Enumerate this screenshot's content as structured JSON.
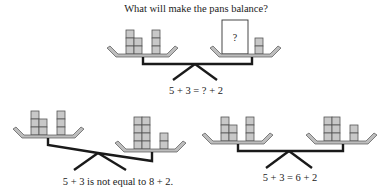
{
  "title": "What will make the pans balance?",
  "colors": {
    "block_fill": "#c8c8c8",
    "block_stroke": "#555555",
    "beam": "#1a1a1a",
    "text": "#222222"
  },
  "diagrams": [
    {
      "id": "top",
      "state": "question",
      "left_pan": {
        "stacks": [
          3,
          2,
          3
        ],
        "total": 5
      },
      "right_pan": {
        "unknown_box_label": "?",
        "stacks": [
          2
        ],
        "total": 2
      },
      "caption": "5 + 3 = ? + 2"
    },
    {
      "id": "bottom-left",
      "state": "unbalanced",
      "left_pan": {
        "stacks": [
          3,
          2,
          3
        ],
        "total": 8
      },
      "right_pan": {
        "stacks": [
          4,
          4,
          2
        ],
        "total": 10
      },
      "caption": "5 + 3 is not equal to 8 + 2."
    },
    {
      "id": "bottom-right",
      "state": "balanced",
      "left_pan": {
        "stacks": [
          3,
          2,
          3
        ],
        "total": 8
      },
      "right_pan": {
        "stacks": [
          3,
          3,
          2
        ],
        "total": 8
      },
      "caption": "5 + 3 = 6 + 2"
    }
  ]
}
